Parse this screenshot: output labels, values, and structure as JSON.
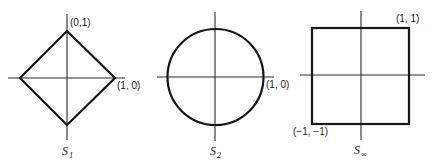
{
  "figure": {
    "panels": [
      {
        "id": "s1",
        "shape": "diamond",
        "caption_main": "S",
        "caption_sub": "1",
        "labels": [
          "(0,1)",
          "(1, 0)"
        ]
      },
      {
        "id": "s2",
        "shape": "circle",
        "caption_main": "S",
        "caption_sub": "2",
        "labels": [
          "(1, 0)"
        ]
      },
      {
        "id": "sinf",
        "shape": "square",
        "caption_main": "S",
        "caption_sub": "∞",
        "labels": [
          "(1, 1)",
          "(−1, −1)"
        ]
      }
    ]
  }
}
